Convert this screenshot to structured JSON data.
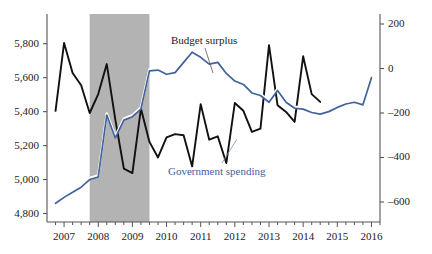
{
  "chart_data": {
    "type": "line",
    "title": "",
    "subtitle": "",
    "xlabel": "",
    "ylabel": "",
    "grid": false,
    "legend_position": "inline-annotation",
    "x_axis": {
      "tick_labels": [
        "2007",
        "2008",
        "2009",
        "2010",
        "2011",
        "2012",
        "2013",
        "2014",
        "2015",
        "2016"
      ],
      "minor_tick_interval": "quarterly",
      "range": [
        2006.5,
        2016.25
      ]
    },
    "y_axis_left": {
      "label": "Government spending (billions of dollars)",
      "tick_labels": [
        "4,800",
        "5,000",
        "5,200",
        "5,400",
        "5,600",
        "5,800"
      ],
      "ticks": [
        4800,
        5000,
        5200,
        5400,
        5600,
        5800
      ],
      "range": [
        4750,
        5975
      ]
    },
    "y_axis_right": {
      "label": "Budget surplus (billions of dollars)",
      "tick_labels": [
        "-600",
        "-400",
        "-200",
        "0",
        "200"
      ],
      "ticks": [
        -600,
        -400,
        -200,
        0,
        200
      ],
      "range": [
        -690,
        245
      ]
    },
    "shaded_region": {
      "label": "Recession",
      "x_start": 2007.75,
      "x_end": 2009.5,
      "color": "#b3b3b3"
    },
    "series": [
      {
        "name": "Budget surplus",
        "axis": "right",
        "color": "#111111",
        "x": [
          2006.75,
          2007.0,
          2007.25,
          2007.5,
          2007.75,
          2008.0,
          2008.25,
          2008.5,
          2008.75,
          2009.0,
          2009.25,
          2009.5,
          2009.75,
          2010.0,
          2010.25,
          2010.5,
          2010.75,
          2011.0,
          2011.25,
          2011.5,
          2011.75,
          2012.0,
          2012.25,
          2012.5,
          2012.75,
          2013.0,
          2013.25,
          2013.5,
          2013.75,
          2014.0,
          2014.25,
          2014.5
        ],
        "values": [
          -190,
          115,
          -20,
          -75,
          -200,
          -115,
          20,
          -230,
          -450,
          -470,
          -180,
          -330,
          -400,
          -310,
          -295,
          -300,
          -440,
          -160,
          -320,
          -305,
          -425,
          -155,
          -190,
          -285,
          -270,
          105,
          -165,
          -195,
          -240,
          55,
          -115,
          -150
        ]
      },
      {
        "name": "Government spending",
        "axis": "left",
        "color": "#41629c",
        "x": [
          2006.75,
          2007.0,
          2007.25,
          2007.5,
          2007.75,
          2008.0,
          2008.25,
          2008.5,
          2008.75,
          2009.0,
          2009.25,
          2009.5,
          2009.75,
          2010.0,
          2010.25,
          2010.5,
          2010.75,
          2011.0,
          2011.25,
          2011.5,
          2011.75,
          2012.0,
          2012.25,
          2012.5,
          2012.75,
          2013.0,
          2013.25,
          2013.5,
          2013.75,
          2014.0,
          2014.25,
          2014.5,
          2014.75,
          2015.0,
          2015.25,
          2015.5,
          2015.75,
          2016.0
        ],
        "values": [
          4860,
          4895,
          4925,
          4955,
          5000,
          5015,
          5380,
          5245,
          5350,
          5370,
          5415,
          5640,
          5645,
          5620,
          5630,
          5690,
          5750,
          5720,
          5680,
          5690,
          5625,
          5580,
          5560,
          5510,
          5495,
          5455,
          5525,
          5455,
          5420,
          5415,
          5395,
          5385,
          5400,
          5425,
          5445,
          5455,
          5440,
          5600
        ]
      }
    ],
    "annotations": [
      {
        "text": "Budget surplus",
        "series": "Budget surplus",
        "leader_line": true
      },
      {
        "text": "Government spending",
        "series": "Government spending",
        "leader_line": true
      }
    ]
  },
  "axes": {
    "left_ticks": [
      "5,800",
      "5,600",
      "5,400",
      "5,200",
      "5,000",
      "4,800"
    ],
    "right_ticks": [
      "200",
      "0",
      "-200",
      "-400",
      "-600"
    ],
    "x_ticks": [
      "2007",
      "2008",
      "2009",
      "2010",
      "2011",
      "2012",
      "2013",
      "2014",
      "2015",
      "2016"
    ]
  },
  "labels": {
    "budget_surplus": "Budget surplus",
    "government_spending": "Government spending"
  },
  "colors": {
    "surplus_line": "#111111",
    "spending_line": "#41629c",
    "recession_band": "#b3b3b3",
    "axis": "#555555",
    "background": "#ffffff"
  }
}
